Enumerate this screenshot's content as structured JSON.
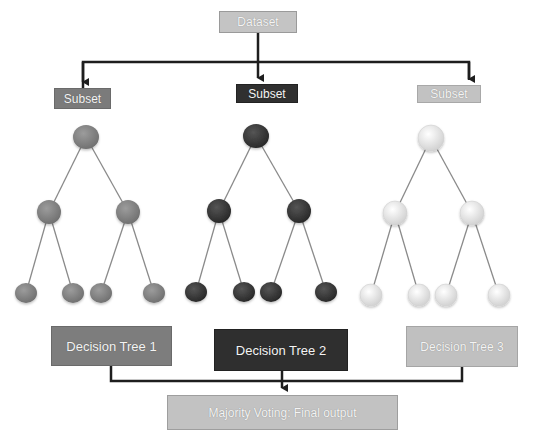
{
  "diagram": {
    "dataset_label": "Dataset",
    "subsets": [
      {
        "label": "Subset",
        "color": "#7b7b7b"
      },
      {
        "label": "Subset",
        "color": "#303030"
      },
      {
        "label": "Subset",
        "color": "#c2c2c2"
      }
    ],
    "trees": [
      {
        "label": "Decision Tree 1",
        "node_color": "#858585",
        "node_highlight": "#a0a0a0"
      },
      {
        "label": "Decision Tree 2",
        "node_color": "#3a3a3a",
        "node_highlight": "#5a5a5a"
      },
      {
        "label": "Decision Tree 3",
        "node_color": "#e4e4e4",
        "node_highlight": "#ffffff"
      }
    ],
    "output_label": "Majority Voting: Final output",
    "colors": {
      "arrow": "#1e1e1e",
      "edge": "#8a8a8a"
    }
  }
}
